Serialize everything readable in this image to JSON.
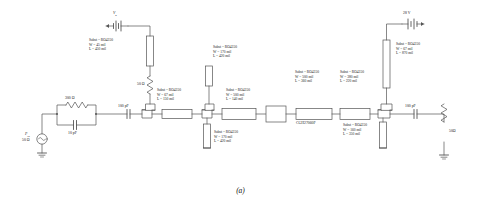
{
  "figure": {
    "caption": "(a)"
  },
  "colors": {
    "wire": "#555555",
    "text": "#222222",
    "background": "#ffffff"
  },
  "source": {
    "name": "input-source",
    "label_power": "P",
    "label_power_sub": "in",
    "label_impedance": "50 Ω"
  },
  "input_network": {
    "resistor_label": "300 Ω",
    "capacitor_label": "10 pF",
    "series_cap_label": "100 pF"
  },
  "gate_bias": {
    "label": "V",
    "label_sub": "g",
    "shunt_resistor": "50 Ω"
  },
  "drain_bias": {
    "label": "28 V"
  },
  "output": {
    "series_cap_label": "100 pF",
    "load_label": "50Ω"
  },
  "transistor": {
    "part_number": "CGH27060F"
  },
  "tlines": [
    {
      "id": "tl-gate-bias-stub",
      "subst": "Subst = RO4350",
      "width": "W = 45 mil",
      "length": "L = 450 mil"
    },
    {
      "id": "tl-input-series-1",
      "subst": "Subst = RO4350",
      "width": "W = 67 mil",
      "length": "L = 150 mil"
    },
    {
      "id": "tl-input-stub-upper",
      "subst": "Subst = RO4350",
      "width": "W = 170 mil",
      "length": "L = 420 mil"
    },
    {
      "id": "tl-input-series-2",
      "subst": "Subst = RO4350",
      "width": "W = 500 mil",
      "length": "L = 140 mil"
    },
    {
      "id": "tl-input-stub-lower",
      "subst": "Subst = RO4350",
      "width": "W = 170 mil",
      "length": "L = 420 mil"
    },
    {
      "id": "tl-output-series-1",
      "subst": "Subst = RO4350",
      "width": "W = 500 mil",
      "length": "L = 360 mil"
    },
    {
      "id": "tl-output-series-2",
      "subst": "Subst = RO4350",
      "width": "W = 380 mil",
      "length": "L = 220 mil"
    },
    {
      "id": "tl-drain-bias-stub",
      "subst": "Subst = RO4350",
      "width": "W = 67 mil",
      "length": "L = 870 mil"
    },
    {
      "id": "tl-output-stub-lower",
      "subst": "Subst = RO4350",
      "width": "W = 160 mil",
      "length": "L = 350 mil"
    }
  ]
}
